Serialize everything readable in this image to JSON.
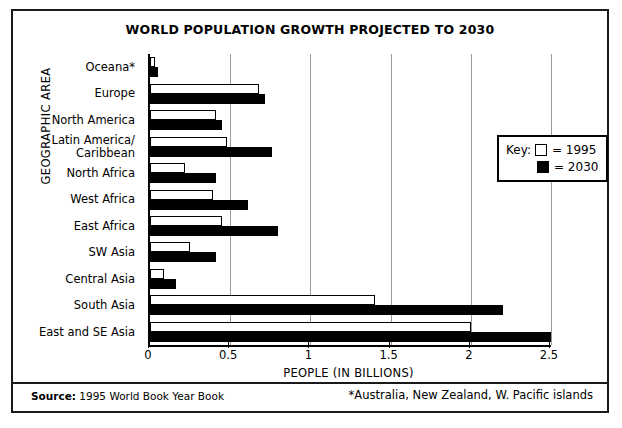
{
  "chart_data": {
    "type": "bar",
    "orientation": "horizontal",
    "title": "WORLD POPULATION GROWTH PROJECTED TO 2030",
    "xlabel": "PEOPLE (IN BILLIONS)",
    "ylabel": "GEOGRAPHIC AREA",
    "xlim": [
      0,
      2.5
    ],
    "xticks": [
      0,
      0.5,
      1,
      1.5,
      2,
      2.5
    ],
    "xtick_labels": [
      "0",
      "0.5",
      "1",
      "1.5",
      "2",
      "2.5"
    ],
    "grid": "vertical",
    "legend_position": "right-upper",
    "categories": [
      "Oceana*",
      "Europe",
      "North America",
      "Latin America/\nCaribbean",
      "North Africa",
      "West Africa",
      "East Africa",
      "SW Asia",
      "Central Asia",
      "South Asia",
      "East and SE Asia"
    ],
    "series": [
      {
        "name": "1995",
        "color": "#ffffff",
        "values": [
          0.03,
          0.68,
          0.41,
          0.48,
          0.22,
          0.39,
          0.45,
          0.25,
          0.09,
          1.4,
          2.0
        ]
      },
      {
        "name": "2030",
        "color": "#000000",
        "values": [
          0.05,
          0.72,
          0.45,
          0.76,
          0.41,
          0.61,
          0.8,
          0.41,
          0.16,
          2.2,
          2.5
        ]
      }
    ]
  },
  "legend": {
    "key_label": "Key:",
    "rows": [
      {
        "swatch": "white",
        "text": "= 1995"
      },
      {
        "swatch": "black",
        "text": "= 2030"
      }
    ]
  },
  "footer": {
    "source_label": "Source:",
    "source_text": "1995 World Book Year Book",
    "footnote": "*Australia, New Zealand, W. Pacific islands"
  }
}
